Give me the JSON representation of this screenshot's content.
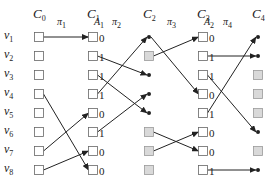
{
  "diagram": {
    "columns": [
      {
        "label": "C",
        "sub": "0",
        "x": 39
      },
      {
        "label": "C",
        "sub": "1",
        "x": 93
      },
      {
        "label": "C",
        "sub": "2",
        "x": 149
      },
      {
        "label": "C",
        "sub": "3",
        "x": 203
      },
      {
        "label": "C",
        "sub": "4",
        "x": 258
      }
    ],
    "annotations": [
      {
        "label": "A",
        "sub": "1",
        "x": 100,
        "y": 22
      },
      {
        "label": "A",
        "sub": "2",
        "x": 210,
        "y": 22
      }
    ],
    "permutations": [
      {
        "label": "π",
        "sub": "1",
        "x": 62,
        "y": 24
      },
      {
        "label": "π",
        "sub": "2",
        "x": 117,
        "y": 24
      },
      {
        "label": "π",
        "sub": "3",
        "x": 172,
        "y": 24
      },
      {
        "label": "π",
        "sub": "4",
        "x": 228,
        "y": 24
      }
    ],
    "rows": [
      {
        "label": "v",
        "sub": "1",
        "y": 37
      },
      {
        "label": "v",
        "sub": "2",
        "y": 56
      },
      {
        "label": "v",
        "sub": "3",
        "y": 75
      },
      {
        "label": "v",
        "sub": "4",
        "y": 94
      },
      {
        "label": "v",
        "sub": "5",
        "y": 113
      },
      {
        "label": "v",
        "sub": "6",
        "y": 132
      },
      {
        "label": "v",
        "sub": "7",
        "y": 151
      },
      {
        "label": "v",
        "sub": "8",
        "y": 170
      }
    ],
    "nodes": {
      "C0": [
        "box",
        "box",
        "box",
        "box",
        "box",
        "box",
        "box",
        "box"
      ],
      "C1": [
        "box",
        "box",
        "box",
        "box",
        "box",
        "box",
        "box",
        "box"
      ],
      "C2": [
        "dot",
        "gray",
        "dot",
        "dot",
        "dot",
        "gray",
        "gray",
        "gray"
      ],
      "C3": [
        "box",
        "box",
        "box",
        "box",
        "box",
        "box",
        "box",
        "box"
      ],
      "C4": [
        "dot",
        "dot",
        "gray",
        "gray",
        "gray",
        "dot",
        "gray",
        "dot"
      ]
    },
    "bits": {
      "A1": [
        "0",
        "1",
        "1",
        "1",
        "0",
        "1",
        "0",
        "0"
      ],
      "A2": [
        "0",
        "1",
        "1",
        "0",
        "1",
        "0",
        "0",
        "1"
      ]
    },
    "edges": {
      "pi1": [
        [
          1,
          1
        ],
        [
          4,
          8
        ],
        [
          7,
          5
        ],
        [
          8,
          7
        ]
      ],
      "pi2": [
        [
          2,
          3
        ],
        [
          3,
          5
        ],
        [
          4,
          1
        ],
        [
          6,
          4
        ]
      ],
      "pi3": [
        [
          2,
          1
        ],
        [
          1,
          4
        ],
        [
          6,
          7
        ],
        [
          7,
          6
        ]
      ],
      "pi4": [
        [
          2,
          2
        ],
        [
          3,
          6
        ],
        [
          5,
          1
        ],
        [
          8,
          8
        ]
      ]
    },
    "colors": {
      "line": "#222222",
      "box_border": "#666666",
      "gray_fill": "#d9d9d9",
      "gray_border": "#999999"
    }
  }
}
